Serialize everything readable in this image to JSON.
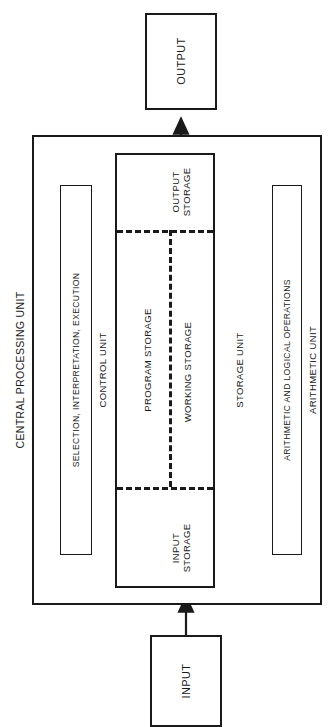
{
  "diagram": {
    "type": "block-diagram",
    "orientation": "rotated-90-ccw",
    "nodes": {
      "output": {
        "label": "OUTPUT"
      },
      "input": {
        "label": "INPUT"
      },
      "cpu": {
        "label": "CENTRAL PROCESSING UNIT"
      },
      "control_unit": {
        "label": "CONTROL UNIT",
        "inner_label": "SELECTION, INTERPRETATION, EXECUTION"
      },
      "arithmetic_unit": {
        "label": "ARITHMETIC UNIT",
        "inner_label": "ARITHMETIC AND LOGICAL OPERATIONS"
      },
      "storage_unit": {
        "label": "STORAGE UNIT",
        "sections": {
          "output_storage": {
            "line1": "OUTPUT",
            "line2": "STORAGE"
          },
          "input_storage": {
            "line1": "INPUT",
            "line2": "STORAGE"
          },
          "program_storage": {
            "label": "PROGRAM STORAGE"
          },
          "working_storage": {
            "label": "WORKING STORAGE"
          }
        }
      }
    },
    "connections": [
      {
        "name": "input-to-cpu",
        "from": "INPUT",
        "to": "CENTRAL PROCESSING UNIT",
        "style": "single-arrow"
      },
      {
        "name": "cpu-to-output",
        "from": "CENTRAL PROCESSING UNIT",
        "to": "OUTPUT",
        "style": "single-arrow"
      },
      {
        "name": "control-storage-upper",
        "from": "CONTROL UNIT",
        "to": "STORAGE UNIT",
        "style": "double-arrow"
      },
      {
        "name": "control-storage-lower",
        "from": "CONTROL UNIT",
        "to": "STORAGE UNIT",
        "style": "double-arrow"
      },
      {
        "name": "storage-arithmetic-upper",
        "from": "STORAGE UNIT",
        "to": "ARITHMETIC UNIT",
        "style": "double-arrow"
      },
      {
        "name": "storage-arithmetic-lower",
        "from": "STORAGE UNIT",
        "to": "ARITHMETIC UNIT",
        "style": "double-arrow"
      }
    ],
    "colors": {
      "stroke": "#1a1a1a",
      "background": "#ffffff"
    }
  }
}
